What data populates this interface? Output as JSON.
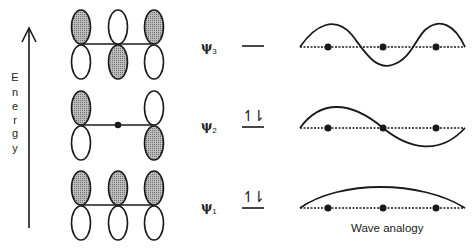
{
  "energy_axis": {
    "label": "Energy",
    "letters": [
      "E",
      "n",
      "e",
      "r",
      "g",
      "y"
    ]
  },
  "orbitals": [
    {
      "name": "psi3",
      "symbol": "ψ",
      "subscript": "3",
      "occupancy": "",
      "shaded_top": [
        true,
        false,
        true
      ],
      "nodes": 2
    },
    {
      "name": "psi2",
      "symbol": "ψ",
      "subscript": "2",
      "occupancy": "↿⇂",
      "shaded_top": [
        true,
        null,
        false
      ],
      "nodes": 1
    },
    {
      "name": "psi1",
      "symbol": "ψ",
      "subscript": "1",
      "occupancy": "↿⇂",
      "shaded_top": [
        true,
        true,
        true
      ],
      "nodes": 0
    }
  ],
  "wave_caption": "Wave analogy",
  "colors": {
    "line": "#1a1a1a",
    "shade": "#9a9a9a"
  }
}
